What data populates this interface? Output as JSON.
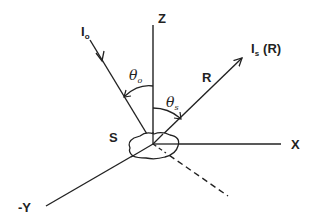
{
  "diagram": {
    "type": "scattering-geometry",
    "axes": {
      "z": "Z",
      "x": "X",
      "neg_y": "-Y"
    },
    "incident": {
      "intensity": "I",
      "subscript": "o",
      "angle": "θ",
      "angle_subscript": "o"
    },
    "scattered": {
      "intensity": "I",
      "subscript": "s",
      "argument": "(R)",
      "vector": "R",
      "angle": "θ",
      "angle_subscript": "s"
    },
    "surface": "S"
  },
  "colors": {
    "line": "#222222",
    "background": "#ffffff"
  }
}
